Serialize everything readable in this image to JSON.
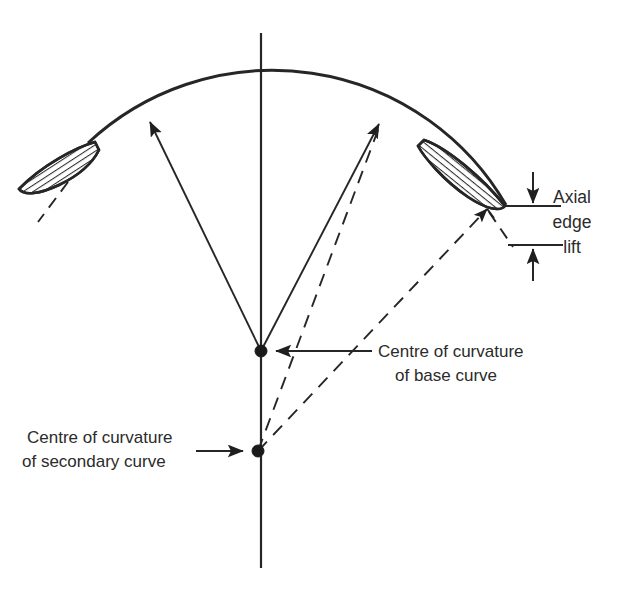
{
  "figure": {
    "background_color": "#ffffff",
    "ink_color": "#262626"
  },
  "labels": {
    "axial_edge_lift": {
      "line1": "Axial",
      "line2": "edge",
      "line3": "lift"
    },
    "base_centre": {
      "line1": "Centre of curvature",
      "line2": "of base curve"
    },
    "secondary_centre": {
      "line1": "Centre of curvature",
      "line2": "of secondary curve"
    }
  },
  "geometry": {
    "optic_axis": {
      "x": 261,
      "y_top": 33,
      "y_bottom": 568
    },
    "base_curve": {
      "apex_x": 261,
      "apex_y": 82,
      "radius": 270,
      "centre_x": 261,
      "centre_y": 351
    },
    "centre_of_base_curve_point": {
      "x": 261,
      "y": 351
    },
    "centre_of_secondary_curve_point": {
      "x": 258,
      "y": 451
    },
    "base_radius_arrows": [
      {
        "from_x": 261,
        "from_y": 351,
        "to_x": 148,
        "to_y": 119
      },
      {
        "from_x": 261,
        "from_y": 351,
        "to_x": 380,
        "to_y": 122
      }
    ],
    "secondary_radius_dashed": [
      {
        "from_x": 258,
        "from_y": 451,
        "to_x": 382,
        "to_y": 120
      },
      {
        "from_x": 258,
        "from_y": 451,
        "to_x": 488,
        "to_y": 207
      }
    ],
    "peripheral_lens_right": {
      "tip_inner_x": 424,
      "tip_inner_y": 140,
      "tip_outer_x": 505,
      "tip_outer_y": 206
    },
    "peripheral_lens_left": {
      "tip_inner_x": 95,
      "tip_inner_y": 142,
      "tip_outer_x": 18,
      "tip_outer_y": 190
    },
    "axial_edge_lift_dimension": {
      "upper_line_y": 206,
      "lower_line_y": 245,
      "line_x_start": 508,
      "line_x_end": 560,
      "arrow_x": 533,
      "upper_arrow_from_y": 172,
      "lower_arrow_from_y": 280
    }
  }
}
